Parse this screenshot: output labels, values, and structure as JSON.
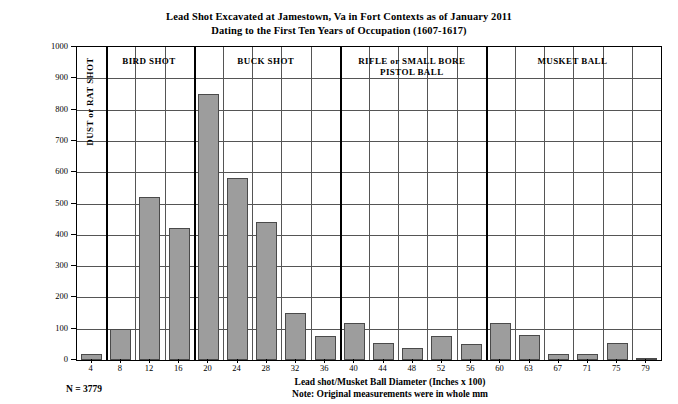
{
  "chart_data": {
    "type": "bar",
    "title": "Lead Shot Excavated at Jamestown, Va in Fort Contexts as of January 2011",
    "subtitle": "Dating to the First Ten Years of Occupation (1607-1617)",
    "xlabel": "Lead shot/Musket Ball Diameter (Inches x 100)",
    "ylabel": "Number of Lead Shot/Musket Balls Excavated",
    "note": "Note: Original measurements were in whole mm",
    "n_label": "N = 3779",
    "grid": true,
    "legend": "none",
    "ylim": [
      0,
      1000
    ],
    "yticks": [
      0,
      100,
      200,
      300,
      400,
      500,
      600,
      700,
      800,
      900,
      1000
    ],
    "categories": [
      "4",
      "8",
      "12",
      "16",
      "20",
      "24",
      "28",
      "32",
      "36",
      "40",
      "44",
      "48",
      "52",
      "56",
      "60",
      "63",
      "67",
      "71",
      "75",
      "79"
    ],
    "values": [
      18,
      100,
      520,
      422,
      850,
      580,
      440,
      150,
      78,
      118,
      55,
      38,
      78,
      50,
      118,
      80,
      18,
      18,
      55,
      5
    ],
    "bar_color": "#9d9d9d",
    "bar_border_color": "#4a4a4a",
    "groups": [
      {
        "label": "DUST or RAT SHOT",
        "start": 0,
        "end": 0,
        "orientation": "vertical"
      },
      {
        "label": "BIRD SHOT",
        "start": 1,
        "end": 3,
        "orientation": "horizontal"
      },
      {
        "label": "BUCK SHOT",
        "start": 4,
        "end": 8,
        "orientation": "horizontal"
      },
      {
        "label": "RIFLE or SMALL BORE\nPISTOL BALL",
        "start": 9,
        "end": 13,
        "orientation": "horizontal"
      },
      {
        "label": "MUSKET BALL",
        "start": 14,
        "end": 19,
        "orientation": "horizontal"
      }
    ]
  }
}
